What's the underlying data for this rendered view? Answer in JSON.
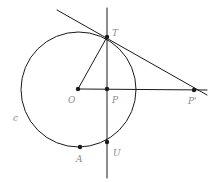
{
  "figure": {
    "background_color": "#ffffff",
    "stroke_color": "#1a1a1a",
    "label_color": "#8a8a8a",
    "width": 216,
    "height": 182
  },
  "circle": {
    "name": "c",
    "label": "c",
    "center_x": 78.5,
    "center_y": 89.5,
    "radius": 57.5,
    "label_x": 13,
    "label_y": 114
  },
  "points": [
    {
      "id": "T",
      "label": "T",
      "x": 107,
      "y": 37,
      "label_x": 112,
      "label_y": 29,
      "dot": true
    },
    {
      "id": "O",
      "label": "O",
      "x": 78,
      "y": 89,
      "label_x": 68,
      "label_y": 96,
      "dot": true
    },
    {
      "id": "P",
      "label": "P",
      "x": 107,
      "y": 89,
      "label_x": 112,
      "label_y": 96,
      "dot": true
    },
    {
      "id": "Pp",
      "label": "P'",
      "x": 194,
      "y": 90,
      "label_x": 188,
      "label_y": 97,
      "dot": true
    },
    {
      "id": "A",
      "label": "A",
      "x": 80,
      "y": 147,
      "label_x": 76,
      "label_y": 155,
      "dot": true
    },
    {
      "id": "U",
      "label": "U",
      "x": 107,
      "y": 142,
      "label_x": 113,
      "label_y": 149,
      "dot": true
    }
  ],
  "lines": [
    {
      "id": "vertical-chord-line",
      "x1": 107,
      "y1": 8,
      "x2": 107,
      "y2": 178
    },
    {
      "id": "horizontal-axis-line",
      "x1": 78,
      "y1": 89,
      "x2": 207,
      "y2": 90
    },
    {
      "id": "tangent-line",
      "x1": 57,
      "y1": 10,
      "x2": 207,
      "y2": 95
    },
    {
      "id": "radius-OT",
      "x1": 78,
      "y1": 89,
      "x2": 107,
      "y2": 37
    }
  ]
}
